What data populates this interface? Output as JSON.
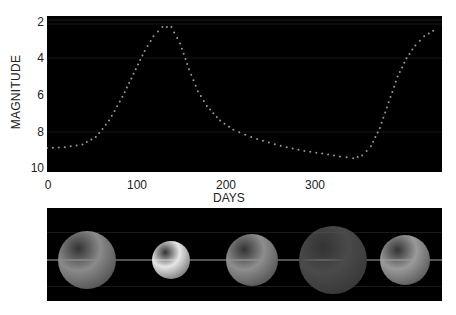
{
  "chart_data": {
    "type": "scatter",
    "title": "",
    "xlabel": "DAYS",
    "ylabel": "MAGNITUDE",
    "xlim": [
      0,
      445
    ],
    "ylim": [
      10,
      2
    ],
    "y_inverted": true,
    "x_ticks": [
      "0",
      "100",
      "200",
      "300"
    ],
    "y_ticks": [
      "2",
      "4",
      "6",
      "8",
      "10"
    ],
    "grid": false,
    "legend": null,
    "series": [
      {
        "name": "light curve",
        "style": "dotted",
        "color": "#9a9a9a",
        "x": [
          0,
          20,
          40,
          55,
          70,
          85,
          100,
          110,
          120,
          130,
          140,
          150,
          160,
          170,
          180,
          195,
          210,
          230,
          250,
          270,
          290,
          310,
          330,
          345,
          355,
          365,
          375,
          385,
          395,
          405,
          415,
          425,
          435
        ],
        "y": [
          8.9,
          8.85,
          8.7,
          8.3,
          7.4,
          6.1,
          4.6,
          3.6,
          2.8,
          2.3,
          2.3,
          3.2,
          4.6,
          5.8,
          6.6,
          7.4,
          7.9,
          8.3,
          8.6,
          8.85,
          9.05,
          9.2,
          9.35,
          9.45,
          9.3,
          8.8,
          7.8,
          6.4,
          5.0,
          4.0,
          3.3,
          2.8,
          2.5
        ]
      }
    ]
  },
  "spheres_panel": {
    "description": "star size and brightness at phases",
    "spheres": [
      {
        "label": "sphere-1",
        "size": 58,
        "color": "#8a8a8a"
      },
      {
        "label": "sphere-2",
        "size": 38,
        "color": "#e6e6e6"
      },
      {
        "label": "sphere-3",
        "size": 52,
        "color": "#8e8e8e"
      },
      {
        "label": "sphere-4",
        "size": 68,
        "color": "#4a4a4a"
      },
      {
        "label": "sphere-5",
        "size": 50,
        "color": "#9a9a9a"
      }
    ]
  }
}
